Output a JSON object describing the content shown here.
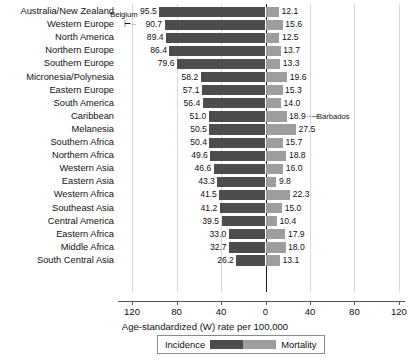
{
  "chart_data": {
    "type": "bar",
    "subtype": "diverging-horizontal-bar",
    "title": "",
    "xlabel": "Age-standardized (W) rate per 100,000",
    "ylabel": "",
    "xlim": [
      -130,
      130
    ],
    "xticks": [
      120,
      80,
      40,
      0,
      40,
      80,
      120
    ],
    "xtick_labels": [
      "120",
      "80",
      "40",
      "0",
      "40",
      "80",
      "120"
    ],
    "grid": true,
    "grid_axis": "x",
    "legend_position": "bottom",
    "categories": [
      "Australia/New Zealand",
      "Western Europe",
      "North America",
      "Northern Europe",
      "Southern Europe",
      "Micronesia/Polynesia",
      "Eastern Europe",
      "South America",
      "Caribbean",
      "Melanesia",
      "Southern Africa",
      "Northern Africa",
      "Western Asia",
      "Eastern Asia",
      "Western Africa",
      "Southeast Asia",
      "Central America",
      "Eastern Africa",
      "Middle Africa",
      "South Central Asia"
    ],
    "series": [
      {
        "name": "Incidence",
        "color": "#4d4d4d",
        "direction": "left",
        "values": [
          95.5,
          90.7,
          89.4,
          86.4,
          79.6,
          58.2,
          57.1,
          56.4,
          51.0,
          50.5,
          50.4,
          49.6,
          46.6,
          43.3,
          41.5,
          41.2,
          39.5,
          33.0,
          32.7,
          26.2
        ]
      },
      {
        "name": "Mortality",
        "color": "#9d9d9d",
        "direction": "right",
        "values": [
          12.1,
          15.6,
          12.5,
          13.7,
          13.3,
          19.6,
          15.3,
          14.0,
          18.9,
          27.5,
          15.7,
          18.8,
          16.0,
          9.8,
          22.3,
          15.0,
          10.4,
          17.9,
          18.0,
          13.1
        ]
      }
    ],
    "annotations": [
      {
        "label": "Belgium",
        "series": "Incidence",
        "category": "Western Europe",
        "value": 90.7
      },
      {
        "label": "Barbados",
        "series": "Mortality",
        "category": "Caribbean",
        "value": 18.9
      }
    ]
  },
  "legend": {
    "incidence_label": "Incidence",
    "mortality_label": "Mortality"
  }
}
